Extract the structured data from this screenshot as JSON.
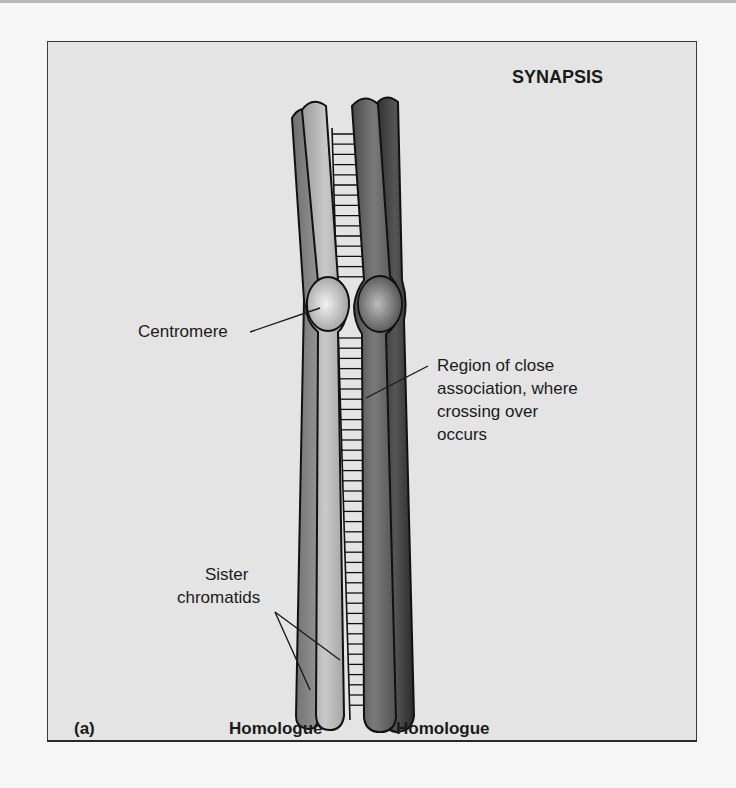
{
  "figure": {
    "title": "SYNAPSIS",
    "panel_label": "(a)",
    "labels": {
      "centromere": "Centromere",
      "region_line1": "Region of close",
      "region_line2": "association, where",
      "region_line3": "crossing over",
      "region_line4": "occurs",
      "sister_line1": "Sister",
      "sister_line2": "chromatids",
      "homologue_left": "Homologue",
      "homologue_right": "Homologue"
    },
    "colors": {
      "background": "#e4e4e4",
      "left_homologue_light": "#b8b8b8",
      "left_homologue_dark": "#8a8a8a",
      "right_homologue_light": "#6a6a6a",
      "right_homologue_dark": "#3c3c3c",
      "outline": "#111111"
    }
  }
}
